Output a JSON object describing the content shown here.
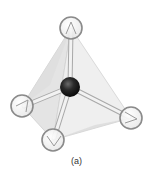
{
  "figure": {
    "caption": "(a)",
    "central_atom": {
      "x": 70,
      "y": 87,
      "r": 10,
      "color": "#1a1a1a"
    },
    "outer_atoms": [
      {
        "id": "top",
        "x": 71,
        "y": 28,
        "r": 11
      },
      {
        "id": "left",
        "x": 22,
        "y": 106,
        "r": 11
      },
      {
        "id": "right",
        "x": 131,
        "y": 118,
        "r": 11
      },
      {
        "id": "bottom",
        "x": 53,
        "y": 140,
        "r": 11
      }
    ],
    "colors": {
      "outer_atom_stroke": "#8a8a8a",
      "outer_atom_fill": "#f7f7f7",
      "bond": "#d9d9d9",
      "bond_edge": "#a8a8a8",
      "face_light": "#f0f0f0",
      "face_mid": "#e2e2e2",
      "face_dark": "#d0d0d0",
      "edge": "#c8c8c8"
    }
  }
}
